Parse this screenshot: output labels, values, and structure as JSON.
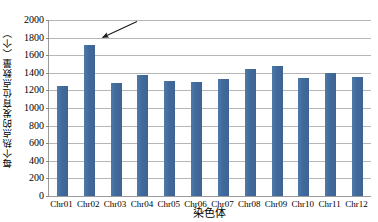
{
  "chart_data": {
    "type": "bar",
    "title": "",
    "subtitle": "",
    "xlabel": "染色体",
    "ylabel": "每个热点的发育位点数量（个）",
    "categories": [
      "Chr01",
      "Chr02",
      "Chr03",
      "Chr04",
      "Chr05",
      "Chr06",
      "Chr07",
      "Chr08",
      "Chr09",
      "Chr10",
      "Chr11",
      "Chr12"
    ],
    "values": [
      1250,
      1720,
      1280,
      1380,
      1310,
      1300,
      1330,
      1440,
      1480,
      1340,
      1400,
      1350
    ],
    "series": [
      {
        "name": "",
        "values": [
          1250,
          1720,
          1280,
          1380,
          1310,
          1300,
          1330,
          1440,
          1480,
          1340,
          1400,
          1350
        ]
      }
    ],
    "ylim": [
      0,
      2000
    ],
    "ytick_step": 200,
    "yticks": [
      0,
      200,
      400,
      600,
      800,
      1000,
      1200,
      1400,
      1600,
      1800,
      2000
    ],
    "ytick_labels": [
      "0",
      "200",
      "400",
      "600",
      "800",
      "1000",
      "1200",
      "1400",
      "1600",
      "1800",
      "2000"
    ],
    "grid": "horizontal",
    "legend": "none",
    "bar_color": "#4472a0",
    "gridline_color": "#b6b6b6",
    "axis_color": "#9a9a9a",
    "annotations": [
      {
        "name": "arrow-to-chr02",
        "kind": "arrow",
        "target_category": "Chr02",
        "target_value": 1720,
        "text": ""
      }
    ]
  }
}
